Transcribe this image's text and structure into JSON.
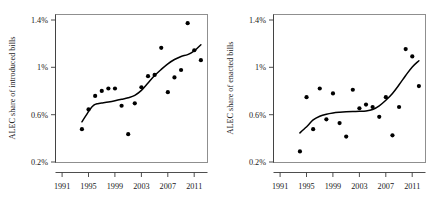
{
  "figure": {
    "background_color": "#ffffff",
    "point_color": "#000000",
    "line_color": "#000000",
    "frame_color": "#8f8f8f"
  },
  "chart_data": [
    {
      "type": "scatter",
      "panel": "left",
      "title": "",
      "xlabel": "",
      "ylabel": "ALEC share of introduced bills",
      "xlim": [
        1990,
        2013
      ],
      "ylim": [
        0.2,
        1.4
      ],
      "grid": false,
      "legend": "none",
      "xticks": [
        1991,
        1995,
        1999,
        2003,
        2007,
        2011
      ],
      "xticklabels": [
        "1991",
        "1995",
        "1999",
        "2003",
        "2007",
        "2011"
      ],
      "yticks": [
        0.2,
        0.6,
        1.0,
        1.4
      ],
      "yticklabels": [
        "0.2%",
        "0.6%",
        "1%",
        "1.4%"
      ],
      "x": [
        1994,
        1995,
        1996,
        1997,
        1998,
        1999,
        2000,
        2001,
        2002,
        2003,
        2004,
        2005,
        2006,
        2007,
        2008,
        2009,
        2010,
        2011,
        2012
      ],
      "y": [
        0.47,
        0.63,
        0.74,
        0.78,
        0.8,
        0.8,
        0.66,
        0.43,
        0.68,
        0.81,
        0.9,
        0.91,
        1.13,
        0.77,
        0.89,
        0.95,
        1.33,
        1.11,
        1.03
      ],
      "smooth": {
        "label": "loess smooth",
        "x": [
          1994,
          1994.6,
          1995.2,
          1995.8,
          1996.4,
          1997,
          1998,
          1999,
          2000,
          2001,
          2002,
          2003,
          2004,
          2005,
          2006,
          2007,
          2008,
          2009,
          2010,
          2011,
          2012
        ],
        "y": [
          0.53,
          0.58,
          0.63,
          0.665,
          0.677,
          0.682,
          0.69,
          0.7,
          0.712,
          0.725,
          0.745,
          0.785,
          0.845,
          0.905,
          0.955,
          1.0,
          1.035,
          1.06,
          1.075,
          1.105,
          1.155
        ]
      }
    },
    {
      "type": "scatter",
      "panel": "right",
      "title": "",
      "xlabel": "",
      "ylabel": "ALEC share of enacted bills",
      "xlim": [
        1990,
        2013
      ],
      "ylim": [
        0.2,
        1.4
      ],
      "grid": false,
      "legend": "none",
      "xticks": [
        1991,
        1995,
        1999,
        2003,
        2007,
        2011
      ],
      "xticklabels": [
        "1991",
        "1995",
        "1999",
        "2003",
        "2007",
        "2011"
      ],
      "yticks": [
        0.2,
        0.6,
        1.0,
        1.4
      ],
      "yticklabels": [
        "0.2%",
        "0.6%",
        "1%",
        "1.4%"
      ],
      "x": [
        1994,
        1995,
        1996,
        1997,
        1998,
        1999,
        2000,
        2001,
        2002,
        2003,
        2004,
        2005,
        2006,
        2007,
        2008,
        2009,
        2010,
        2011,
        2012
      ],
      "y": [
        0.29,
        0.73,
        0.47,
        0.8,
        0.55,
        0.76,
        0.52,
        0.41,
        0.79,
        0.64,
        0.67,
        0.65,
        0.57,
        0.73,
        0.42,
        0.65,
        1.12,
        1.06,
        0.82
      ],
      "smooth": {
        "label": "loess smooth",
        "x": [
          1994,
          1994.6,
          1995.2,
          1996,
          1997,
          1998,
          1999,
          2000,
          2001,
          2002,
          2003,
          2004,
          2005,
          2006,
          2007,
          2008,
          2009,
          2010,
          2011,
          2012
        ],
        "y": [
          0.44,
          0.47,
          0.5,
          0.545,
          0.575,
          0.592,
          0.602,
          0.608,
          0.612,
          0.614,
          0.615,
          0.618,
          0.63,
          0.66,
          0.705,
          0.76,
          0.83,
          0.905,
          0.975,
          1.025
        ]
      }
    }
  ]
}
